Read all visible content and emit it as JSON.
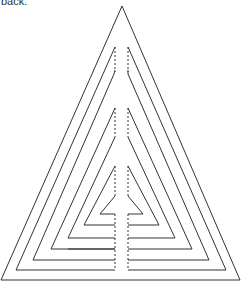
{
  "caption": "back.",
  "diagram": {
    "type": "nested-triangle-cut-pattern",
    "stroke_color": "#333333",
    "outer_triangle": {
      "apex": [
        122,
        6
      ],
      "bottom_left": [
        1,
        280
      ],
      "bottom_right": [
        240,
        280
      ]
    },
    "layers": 5
  }
}
